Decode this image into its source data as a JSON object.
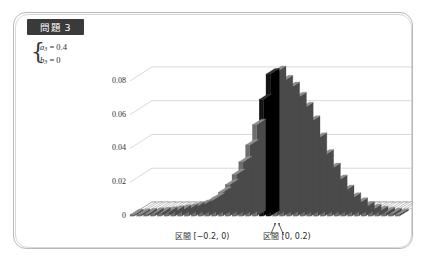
{
  "slide": {
    "badge_label": "問題 3",
    "frame": "rounded-rectangle"
  },
  "equation": {
    "line1_var": "a",
    "line1_sub": "3",
    "line1_eq": " = 0.4",
    "line2_var": "b",
    "line2_sub": "3",
    "line2_eq": " = 0",
    "brace": "{"
  },
  "annotations": {
    "left_label": "区間 [−0.2, 0)",
    "right_label": "区間 [0, 0.2)",
    "arrow_left": "arrow-up-left",
    "arrow_right": "arrow-up-right"
  },
  "colors": {
    "badge_bg": "#3a3a3a",
    "badge_text": "#ffffff",
    "frame": "#b9b9b9",
    "bar_front": "#6e6e6e",
    "bar_side": "#4a4a4a",
    "bar_top": "#8d8d8d",
    "bar_highlight": "#141414",
    "gridline": "#c9c9c9",
    "axis_text": "#2e2e2e"
  },
  "chart_data": {
    "type": "bar",
    "title": "",
    "subtitle": "",
    "xlabel": "",
    "ylabel": "",
    "ylim": [
      0,
      0.09
    ],
    "grid": true,
    "legend": null,
    "projection": "3d-isometric",
    "y_ticks": [
      "0",
      "0.02",
      "0.04",
      "0.06",
      "0.08"
    ],
    "y_tick_values": [
      0,
      0.02,
      0.04,
      0.06,
      0.08
    ],
    "highlight_bins": [
      19,
      20
    ],
    "highlight_labels": [
      "区間 [−0.2, 0)",
      "区間 [0, 0.2)"
    ],
    "bin_width": 0.2,
    "x_range": [
      -4.0,
      4.0
    ],
    "categories": [
      "-4.0",
      "-3.8",
      "-3.6",
      "-3.4",
      "-3.2",
      "-3.0",
      "-2.8",
      "-2.6",
      "-2.4",
      "-2.2",
      "-2.0",
      "-1.8",
      "-1.6",
      "-1.4",
      "-1.2",
      "-1.0",
      "-0.8",
      "-0.6",
      "-0.4",
      "-0.2",
      "0.0",
      "0.2",
      "0.4",
      "0.6",
      "0.8",
      "1.0",
      "1.2",
      "1.4",
      "1.6",
      "1.8",
      "2.0",
      "2.2",
      "2.4",
      "2.6",
      "2.8",
      "3.0",
      "3.2",
      "3.4",
      "3.6",
      "3.8"
    ],
    "values": [
      0.0008,
      0.001,
      0.0012,
      0.0015,
      0.0018,
      0.0022,
      0.0027,
      0.0033,
      0.004,
      0.005,
      0.0062,
      0.008,
      0.0105,
      0.014,
      0.0185,
      0.0245,
      0.032,
      0.042,
      0.054,
      0.069,
      0.084,
      0.0855,
      0.08,
      0.076,
      0.07,
      0.064,
      0.056,
      0.046,
      0.036,
      0.028,
      0.021,
      0.015,
      0.0105,
      0.0075,
      0.0052,
      0.0036,
      0.0026,
      0.0019,
      0.0014,
      0.001
    ]
  }
}
